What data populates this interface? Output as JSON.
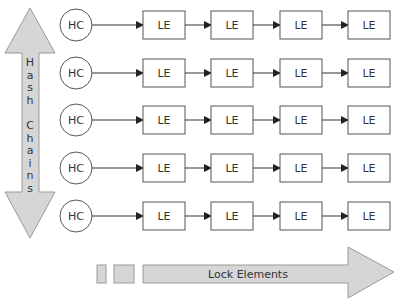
{
  "diagram": {
    "vertical_arrow": {
      "label": "Hash Chains",
      "letters": [
        "H",
        "a",
        "s",
        "h",
        "",
        "C",
        "h",
        "a",
        "i",
        "n",
        "s"
      ]
    },
    "horizontal_arrow": {
      "label": "Lock Elements"
    },
    "rows": [
      {
        "head": "HC",
        "elements": [
          "LE",
          "LE",
          "LE",
          "LE"
        ]
      },
      {
        "head": "HC",
        "elements": [
          "LE",
          "LE",
          "LE",
          "LE"
        ]
      },
      {
        "head": "HC",
        "elements": [
          "LE",
          "LE",
          "LE",
          "LE"
        ]
      },
      {
        "head": "HC",
        "elements": [
          "LE",
          "LE",
          "LE",
          "LE"
        ]
      },
      {
        "head": "HC",
        "elements": [
          "LE",
          "LE",
          "LE",
          "LE"
        ]
      }
    ],
    "colors": {
      "arrow_fill": "#d6d6d6",
      "arrow_stroke": "#999999",
      "line": "#333333"
    }
  }
}
